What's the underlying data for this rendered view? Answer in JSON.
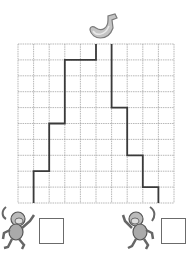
{
  "puzzle": {
    "type": "maze-path",
    "grid": {
      "cols": 10,
      "rows": 10,
      "x": 18,
      "y": 44,
      "width": 156,
      "height": 159,
      "line_color": "#9a9a9a",
      "path_color": "#3a3a3a"
    },
    "goal": {
      "icon": "banana-icon",
      "color": "#b8b8b8"
    },
    "paths": [
      {
        "name": "left-path",
        "points": [
          [
            5,
            0
          ],
          [
            5,
            1
          ],
          [
            3,
            1
          ],
          [
            3,
            5
          ],
          [
            2,
            5
          ],
          [
            2,
            8
          ],
          [
            1,
            8
          ],
          [
            1,
            10
          ]
        ]
      },
      {
        "name": "right-path",
        "points": [
          [
            6,
            0
          ],
          [
            6,
            4
          ],
          [
            7,
            4
          ],
          [
            7,
            7
          ],
          [
            8,
            7
          ],
          [
            8,
            9
          ],
          [
            9,
            9
          ],
          [
            9,
            10
          ]
        ]
      }
    ],
    "players": [
      {
        "icon": "monkey-icon",
        "answer_box": ""
      },
      {
        "icon": "monkey-icon",
        "answer_box": ""
      }
    ]
  }
}
